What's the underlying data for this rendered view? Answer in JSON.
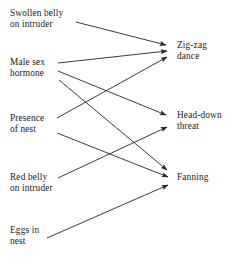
{
  "diagram": {
    "type": "bipartite-causal-arrow-diagram",
    "background_color": "#ffffff",
    "line_color": "#262626",
    "text_color": "#1a1a1a",
    "stimuli": [
      {
        "id": "swollen-belly",
        "label": "Swollen belly\non intruder",
        "x": 10,
        "y": 8
      },
      {
        "id": "male-sex-hormone",
        "label": "Male sex\nhormone",
        "x": 10,
        "y": 57
      },
      {
        "id": "presence-of-nest",
        "label": "Presence\nof nest",
        "x": 10,
        "y": 113
      },
      {
        "id": "red-belly",
        "label": "Red belly\non intruder",
        "x": 10,
        "y": 172
      },
      {
        "id": "eggs-in-nest",
        "label": "Eggs in\nnest",
        "x": 10,
        "y": 225
      }
    ],
    "behaviours": [
      {
        "id": "zig-zag-dance",
        "label": "Zig-zag\ndance",
        "x": 177,
        "y": 40
      },
      {
        "id": "head-down-threat",
        "label": "Head-down\nthreat",
        "x": 177,
        "y": 110
      },
      {
        "id": "fanning",
        "label": "Fanning",
        "x": 177,
        "y": 172
      }
    ],
    "edges": [
      {
        "from": "swollen-belly",
        "to": "zig-zag-dance",
        "x1": 76,
        "y1": 22,
        "x2": 166,
        "y2": 45
      },
      {
        "from": "male-sex-hormone",
        "to": "zig-zag-dance",
        "x1": 58,
        "y1": 63,
        "x2": 167,
        "y2": 51
      },
      {
        "from": "male-sex-hormone",
        "to": "head-down-threat",
        "x1": 58,
        "y1": 71,
        "x2": 166,
        "y2": 115
      },
      {
        "from": "male-sex-hormone",
        "to": "fanning",
        "x1": 59,
        "y1": 80,
        "x2": 167,
        "y2": 170
      },
      {
        "from": "presence-of-nest",
        "to": "zig-zag-dance",
        "x1": 57,
        "y1": 118,
        "x2": 167,
        "y2": 57
      },
      {
        "from": "presence-of-nest",
        "to": "fanning",
        "x1": 57,
        "y1": 133,
        "x2": 168,
        "y2": 177
      },
      {
        "from": "red-belly",
        "to": "head-down-threat",
        "x1": 58,
        "y1": 178,
        "x2": 167,
        "y2": 127
      },
      {
        "from": "eggs-in-nest",
        "to": "fanning",
        "x1": 47,
        "y1": 238,
        "x2": 168,
        "y2": 185
      }
    ]
  }
}
